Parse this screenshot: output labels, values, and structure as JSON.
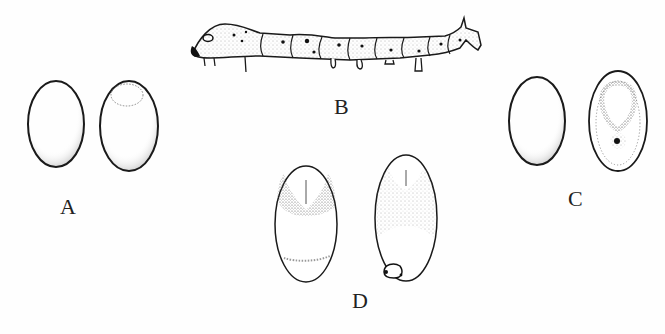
{
  "figure": {
    "panels": [
      {
        "id": "A",
        "label": "A",
        "subject": "two eggs, left plain and right with faint outlined spot near the top"
      },
      {
        "id": "B",
        "label": "B",
        "subject": "larva (caterpillar) side view, stippled, with dark head, spots and a dorsal horn"
      },
      {
        "id": "C",
        "label": "C",
        "subject": "two eggs, right with stippled ring and dark dot"
      },
      {
        "id": "D",
        "label": "D",
        "subject": "two eggs with developing embryo, stippled shading"
      }
    ],
    "colors": {
      "background": "#fefefe",
      "ink": "#1a1a1a",
      "stipple": "#555555"
    }
  }
}
